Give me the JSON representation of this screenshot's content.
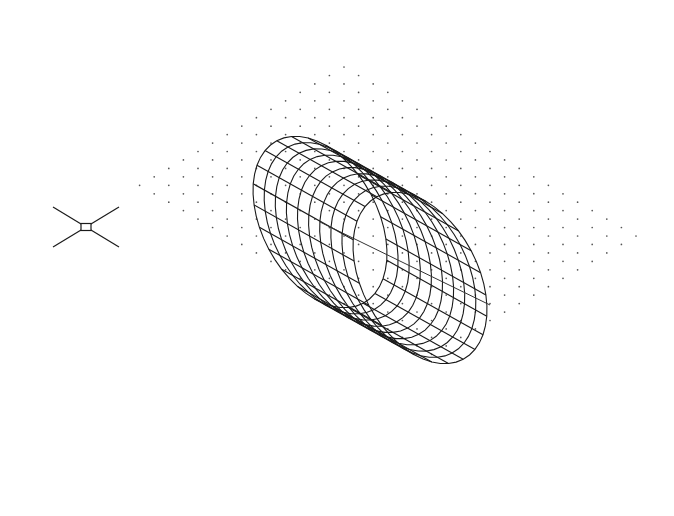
{
  "viewport": {
    "name": "CAD model space viewport",
    "background": "#ffffff",
    "view": "SE isometric"
  },
  "grid": {
    "style": "dots",
    "color": "#555555",
    "origin": [
      344,
      67
    ],
    "col_step": [
      14.6,
      8.45
    ],
    "row_step": [
      -14.6,
      8.45
    ],
    "cols": 21,
    "rows": 15,
    "dot_radius": 0.85
  },
  "cylinder": {
    "color": "#1a1a1a",
    "near_center": [
      320,
      222
    ],
    "far_center": [
      418,
      246
    ],
    "rx": 58,
    "ry": 92,
    "tilt_deg": -28,
    "length_vec": [
      100,
      56
    ],
    "longitudinal_lines": 24,
    "rings": 9,
    "axis_start": [
      320,
      222
    ],
    "axis_end": [
      490,
      305
    ]
  },
  "ucs_icon": {
    "name": "UCS icon",
    "center": [
      86,
      227
    ],
    "arm_dx": 33,
    "arm_dy": 20,
    "box_w": 10,
    "box_h": 7
  }
}
